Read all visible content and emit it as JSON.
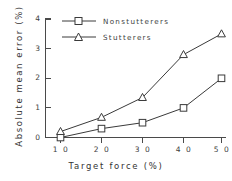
{
  "chart_data": {
    "type": "line",
    "title": "",
    "xlabel": "Target  force  (%)",
    "ylabel": "Absolute  mean  error  (%)",
    "x": [
      10,
      20,
      30,
      40,
      50
    ],
    "xticklabels": [
      "1 0",
      "2 0",
      "3 0",
      "4 0",
      "5 0"
    ],
    "yticklabels": [
      "0",
      "1",
      "2",
      "3",
      "4"
    ],
    "yticks": [
      0,
      1,
      2,
      3,
      4
    ],
    "xlim": [
      5,
      55
    ],
    "ylim": [
      0,
      4
    ],
    "grid": false,
    "legend_position": "upper-left-inside",
    "series": [
      {
        "name": "Nonstutterers",
        "marker": "square",
        "color": "#3a3a3a",
        "values": [
          0.0,
          0.3,
          0.5,
          1.0,
          2.0
        ]
      },
      {
        "name": "Stutterers",
        "marker": "triangle",
        "color": "#3a3a3a",
        "values": [
          0.2,
          0.68,
          1.35,
          2.8,
          3.5
        ]
      }
    ]
  },
  "legend": {
    "entries": [
      {
        "label": "Nonstutterers"
      },
      {
        "label": "Stutterers"
      }
    ]
  }
}
